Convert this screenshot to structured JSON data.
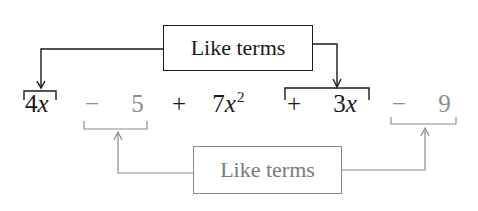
{
  "diagram": {
    "top_label": "Like terms",
    "bottom_label": "Like terms",
    "expression": {
      "terms": [
        {
          "id": "t1",
          "sign": "",
          "coef": "4",
          "var": "x",
          "exp": "",
          "group": "top"
        },
        {
          "id": "t2",
          "sign": "−",
          "coef": "5",
          "var": "",
          "exp": "",
          "group": "bottom"
        },
        {
          "id": "t3",
          "sign": "+",
          "coef": "7",
          "var": "x",
          "exp": "2",
          "group": "none"
        },
        {
          "id": "t4",
          "sign": "+",
          "coef": "3",
          "var": "x",
          "exp": "",
          "group": "top"
        },
        {
          "id": "t5",
          "sign": "−",
          "coef": "9",
          "var": "",
          "exp": "",
          "group": "bottom"
        }
      ],
      "full_text": "4x − 5 + 7x² + 3x − 9"
    },
    "colors": {
      "top_group": "#1a1a1a",
      "bottom_group": "#8c8c8c",
      "background": "#ffffff"
    }
  }
}
